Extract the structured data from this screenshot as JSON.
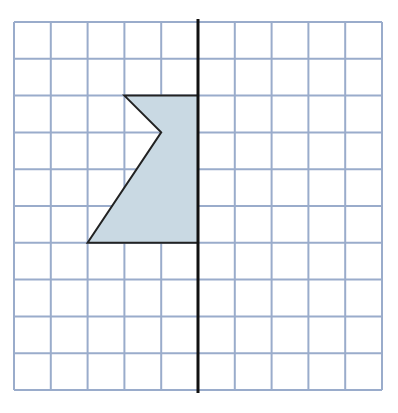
{
  "diagram": {
    "type": "reflection-grid",
    "grid": {
      "columns": 10,
      "rows": 10,
      "origin_px": [
        14,
        22
      ],
      "cell_px": 36.8,
      "line_color": "#9aaccb",
      "background": "#ffffff"
    },
    "mirror_line": {
      "orientation": "vertical",
      "grid_x": 5,
      "color": "#111111"
    },
    "shape": {
      "fill": "#c9d9e3",
      "stroke": "#222222",
      "vertices_grid": [
        [
          3,
          2
        ],
        [
          5,
          2
        ],
        [
          5,
          6
        ],
        [
          2,
          6
        ],
        [
          4,
          3
        ]
      ]
    }
  }
}
